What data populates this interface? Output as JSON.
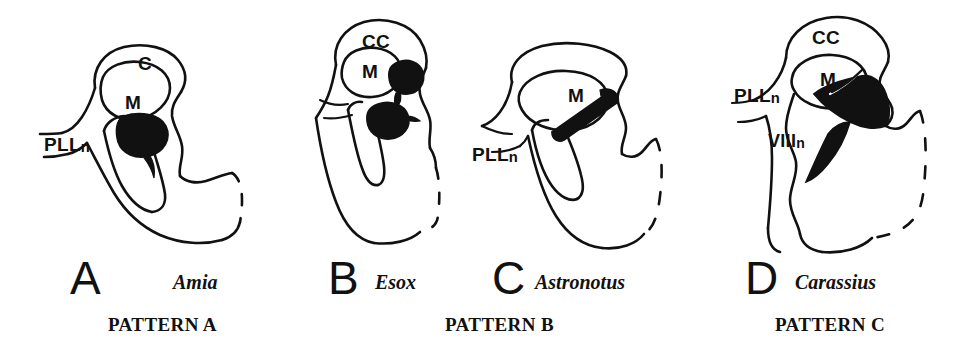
{
  "figure": {
    "background_color": "#ffffff",
    "ink_color": "#111111"
  },
  "panels": [
    {
      "letter": "A",
      "genus": "Amia",
      "pattern": "PATTERN A",
      "labels": [
        {
          "text": "C",
          "sub": ""
        },
        {
          "text": "M",
          "sub": ""
        },
        {
          "text": "PLL",
          "sub": "n"
        }
      ]
    },
    {
      "letter": "B",
      "genus": "Esox",
      "pattern": "PATTERN B",
      "labels": [
        {
          "text": "CC",
          "sub": ""
        },
        {
          "text": "M",
          "sub": ""
        }
      ]
    },
    {
      "letter": "C",
      "genus": "Astronotus",
      "pattern": "",
      "labels": [
        {
          "text": "M",
          "sub": ""
        },
        {
          "text": "PLL",
          "sub": "n"
        }
      ]
    },
    {
      "letter": "D",
      "genus": "Carassius",
      "pattern": "PATTERN C",
      "labels": [
        {
          "text": "CC",
          "sub": ""
        },
        {
          "text": "M",
          "sub": ""
        },
        {
          "text": "PLL",
          "sub": "n"
        },
        {
          "text": "VIII",
          "sub": "n"
        }
      ]
    }
  ]
}
